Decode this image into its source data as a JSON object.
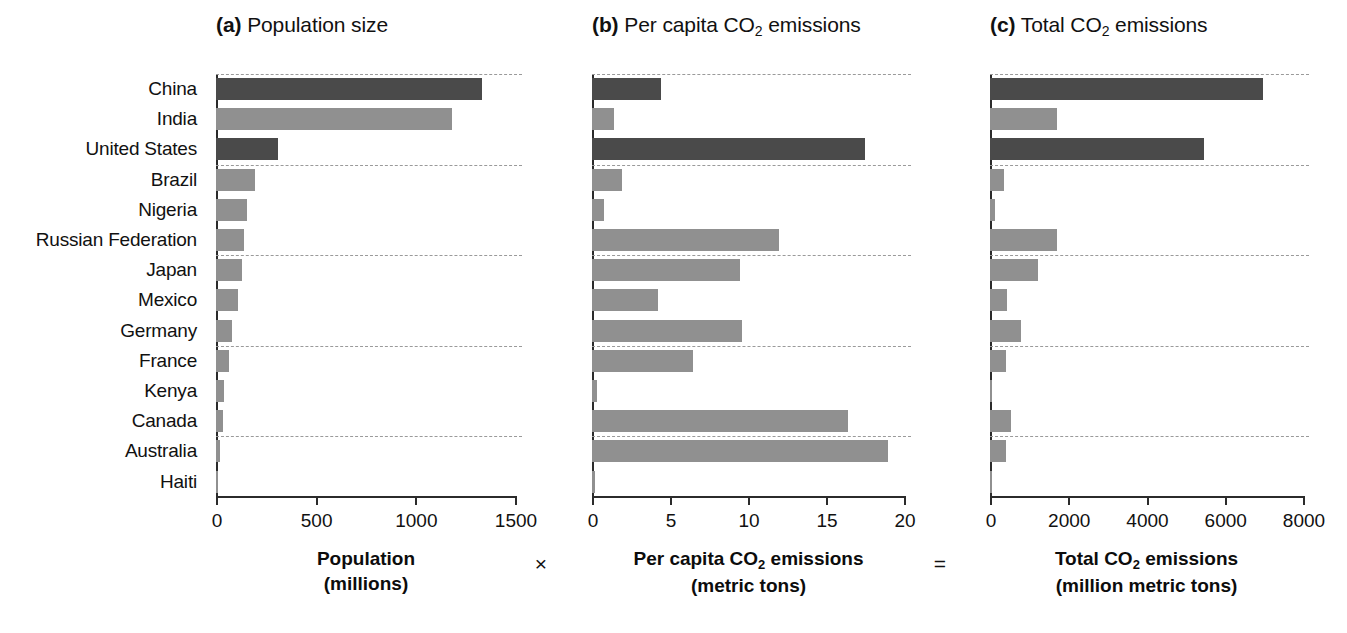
{
  "figure": {
    "width": 1347,
    "height": 633,
    "operators": {
      "times": "×",
      "equals": "="
    },
    "colors": {
      "bar_dark": "#4a4a4a",
      "bar_light": "#909090",
      "axis": "#2b2b2b",
      "grid": "#9a9a9a"
    }
  },
  "panels": {
    "a": {
      "tag": "(a)",
      "title": "Population size",
      "caption_line1": "Population",
      "caption_line2": "(millions)"
    },
    "b": {
      "tag": "(b)",
      "title_pre": "Per capita CO",
      "title_sub": "2",
      "title_post": " emissions",
      "caption_line1_pre": "Per capita CO",
      "caption_line1_sub": "2",
      "caption_line1_post": " emissions",
      "caption_line2": "(metric tons)"
    },
    "c": {
      "tag": "(c)",
      "title_pre": "Total CO",
      "title_sub": "2",
      "title_post": " emissions",
      "caption_line1_pre": "Total CO",
      "caption_line1_sub": "2",
      "caption_line1_post": " emissions",
      "caption_line2": "(million metric tons)"
    }
  },
  "chart_data": [
    {
      "id": "a",
      "type": "bar",
      "orientation": "horizontal",
      "title": "(a) Population size",
      "xlabel": "Population (millions)",
      "ylabel": "",
      "xlim": [
        0,
        1500
      ],
      "xticks": [
        0,
        500,
        1000,
        1500
      ],
      "xticklabels": [
        "0",
        "500",
        "1000",
        "1500"
      ],
      "grid": "horizontal-dashed",
      "legend": "none",
      "categories": [
        "China",
        "India",
        "United States",
        "Brazil",
        "Nigeria",
        "Russian Federation",
        "Japan",
        "Mexico",
        "Germany",
        "France",
        "Kenya",
        "Canada",
        "Australia",
        "Haiti"
      ],
      "values": [
        1335,
        1185,
        309,
        195,
        155,
        142,
        128,
        108,
        82,
        65,
        40,
        34,
        22,
        10
      ],
      "bar_shades": [
        "dark",
        "light",
        "dark",
        "light",
        "light",
        "light",
        "light",
        "light",
        "light",
        "light",
        "light",
        "light",
        "light",
        "light"
      ]
    },
    {
      "id": "b",
      "type": "bar",
      "orientation": "horizontal",
      "title": "(b) Per capita CO2 emissions",
      "xlabel": "Per capita CO2 emissions (metric tons)",
      "ylabel": "",
      "xlim": [
        0,
        20
      ],
      "xticks": [
        0,
        5,
        10,
        15,
        20
      ],
      "xticklabels": [
        "0",
        "5",
        "10",
        "15",
        "20"
      ],
      "grid": "horizontal-dashed",
      "legend": "none",
      "categories": [
        "China",
        "India",
        "United States",
        "Brazil",
        "Nigeria",
        "Russian Federation",
        "Japan",
        "Mexico",
        "Germany",
        "France",
        "Kenya",
        "Canada",
        "Australia",
        "Haiti"
      ],
      "values": [
        4.4,
        1.4,
        17.5,
        1.9,
        0.8,
        12.0,
        9.5,
        4.2,
        9.6,
        6.5,
        0.3,
        16.4,
        19.0,
        0.2
      ],
      "bar_shades": [
        "dark",
        "light",
        "dark",
        "light",
        "light",
        "light",
        "light",
        "light",
        "light",
        "light",
        "light",
        "light",
        "light",
        "light"
      ]
    },
    {
      "id": "c",
      "type": "bar",
      "orientation": "horizontal",
      "title": "(c) Total CO2 emissions",
      "xlabel": "Total CO2 emissions (million metric tons)",
      "ylabel": "",
      "xlim": [
        0,
        8000
      ],
      "xticks": [
        0,
        2000,
        4000,
        6000,
        8000
      ],
      "xticklabels": [
        "0",
        "2000",
        "4000",
        "6000",
        "8000"
      ],
      "grid": "horizontal-dashed",
      "legend": "none",
      "categories": [
        "China",
        "India",
        "United States",
        "Brazil",
        "Nigeria",
        "Russian Federation",
        "Japan",
        "Mexico",
        "Germany",
        "France",
        "Kenya",
        "Canada",
        "Australia",
        "Haiti"
      ],
      "values": [
        6990,
        1700,
        5460,
        370,
        120,
        1720,
        1220,
        445,
        790,
        415,
        12,
        545,
        400,
        2
      ],
      "bar_shades": [
        "dark",
        "light",
        "dark",
        "light",
        "light",
        "light",
        "light",
        "light",
        "light",
        "light",
        "light",
        "light",
        "light",
        "light"
      ]
    }
  ]
}
